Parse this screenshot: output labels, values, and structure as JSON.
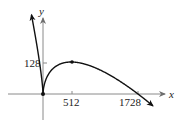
{
  "chart_data": {
    "type": "line",
    "title": "",
    "xlabel": "x",
    "ylabel": "y",
    "function": "f(x) = 6x^(2/3) - x/2",
    "x_ticks": [
      {
        "value": 512,
        "label": "512"
      },
      {
        "value": 1728,
        "label": "1728"
      }
    ],
    "y_ticks": [
      {
        "value": 128,
        "label": "128"
      }
    ],
    "points": [
      {
        "x": 0,
        "y": 0,
        "label": "cusp (origin)"
      },
      {
        "x": 512,
        "y": 128,
        "label": "local maximum"
      },
      {
        "x": 1728,
        "y": 0,
        "label": "x-intercept"
      }
    ],
    "x_range": [
      -780,
      2300
    ],
    "y_range": [
      -100,
      310
    ],
    "grid": false,
    "legend": "none",
    "colors": {
      "curve": "#111111",
      "axes": "#7a7a7a",
      "text": "#222222"
    }
  }
}
